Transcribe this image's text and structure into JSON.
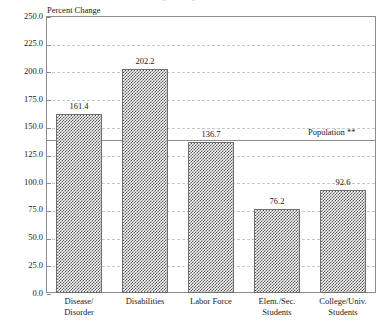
{
  "chart_data": {
    "type": "bar",
    "title": "Percent Change in Population, 1970 to 2000",
    "ylabel": "Percent Change",
    "xlabel": "",
    "ylim": [
      0,
      250
    ],
    "ytick_step": 25,
    "grid": true,
    "legend": "none",
    "categories": [
      "Disease/ Disorder",
      "Disabilities",
      "Labor Force",
      "Elem./Sec. Students",
      "College/Univ. Students"
    ],
    "category_lines": [
      [
        "Disease/",
        "Disorder"
      ],
      [
        "Disabilities",
        ""
      ],
      [
        "Labor Force",
        ""
      ],
      [
        "Elem./Sec.",
        "Students"
      ],
      [
        "College/Univ.",
        "Students"
      ]
    ],
    "values": [
      161.4,
      202.2,
      136.7,
      76.2,
      92.6
    ],
    "value_labels": [
      "161.4",
      "202.2",
      "136.7",
      "76.2",
      "92.6"
    ],
    "ytick_labels": [
      "0.0",
      "25.0",
      "50.0",
      "75.0",
      "100.0",
      "125.0",
      "150.0",
      "175.0",
      "200.0",
      "225.0",
      "250.0"
    ],
    "annotations": [
      {
        "name": "population-reference",
        "label": "Population **",
        "value": 139.0
      }
    ],
    "colors": {
      "bar_fill": "#555555",
      "bar_edge": "#6f6f6f",
      "grid": "#c8c8c8",
      "axis": "#8d8d8d",
      "text": "#1a1a1a"
    }
  }
}
